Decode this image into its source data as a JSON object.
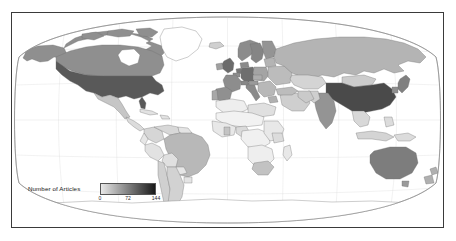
{
  "figure": {
    "type": "choropleth-world-map",
    "projection": "robinson",
    "frame_color": "#3a3a3a",
    "background": "#ffffff"
  },
  "legend": {
    "title": "Number of Articles",
    "gradient_low_color": "#e8e8e8",
    "gradient_high_color": "#1a1a1a",
    "ticks": [
      {
        "label": "0",
        "value": 0,
        "pos_pct": 0
      },
      {
        "label": "72",
        "value": 72,
        "pos_pct": 50
      },
      {
        "label": "144",
        "value": 144,
        "pos_pct": 100
      }
    ]
  },
  "chart_data": {
    "type": "heatmap",
    "title": "",
    "xlabel": "",
    "ylabel": "",
    "legend_label": "Number of Articles",
    "value_range": [
      0,
      144
    ],
    "colorscale": [
      "#ffffff",
      "#e8e8e8",
      "#c9c9c9",
      "#a8a8a8",
      "#8a8a8a",
      "#6b6b6b",
      "#4a4a4a",
      "#2b2b2b"
    ],
    "countries": [
      {
        "name": "United States",
        "value": 144,
        "color": "#595959"
      },
      {
        "name": "China",
        "value": 140,
        "color": "#4a4a4a"
      },
      {
        "name": "United Kingdom",
        "value": 105,
        "color": "#6b6b6b"
      },
      {
        "name": "Germany",
        "value": 100,
        "color": "#6e6e6e"
      },
      {
        "name": "Canada",
        "value": 88,
        "color": "#8f8f8f"
      },
      {
        "name": "Australia",
        "value": 86,
        "color": "#7d7d7d"
      },
      {
        "name": "Japan",
        "value": 80,
        "color": "#808080"
      },
      {
        "name": "India",
        "value": 72,
        "color": "#949494"
      },
      {
        "name": "Netherlands",
        "value": 68,
        "color": "#787878"
      },
      {
        "name": "Italy",
        "value": 62,
        "color": "#8a8a8a"
      },
      {
        "name": "France",
        "value": 60,
        "color": "#8d8d8d"
      },
      {
        "name": "Spain",
        "value": 55,
        "color": "#909090"
      },
      {
        "name": "Sweden",
        "value": 52,
        "color": "#858585"
      },
      {
        "name": "Norway",
        "value": 48,
        "color": "#8c8c8c"
      },
      {
        "name": "Finland",
        "value": 45,
        "color": "#949494"
      },
      {
        "name": "Denmark",
        "value": 44,
        "color": "#8a8a8a"
      },
      {
        "name": "Switzerland",
        "value": 42,
        "color": "#888888"
      },
      {
        "name": "Belgium",
        "value": 40,
        "color": "#8e8e8e"
      },
      {
        "name": "Austria",
        "value": 36,
        "color": "#9a9a9a"
      },
      {
        "name": "Poland",
        "value": 34,
        "color": "#a4a4a4"
      },
      {
        "name": "Russia",
        "value": 30,
        "color": "#b4b4b4"
      },
      {
        "name": "Brazil",
        "value": 28,
        "color": "#b8b8b8"
      },
      {
        "name": "South Korea",
        "value": 26,
        "color": "#8f8f8f"
      },
      {
        "name": "Turkey",
        "value": 24,
        "color": "#bcbcbc"
      },
      {
        "name": "South Africa",
        "value": 22,
        "color": "#c2c2c2"
      },
      {
        "name": "Mexico",
        "value": 20,
        "color": "#c6c6c6"
      },
      {
        "name": "New Zealand",
        "value": 20,
        "color": "#b0b0b0"
      },
      {
        "name": "Ireland",
        "value": 18,
        "color": "#a0a0a0"
      },
      {
        "name": "Portugal",
        "value": 18,
        "color": "#a8a8a8"
      },
      {
        "name": "Greece",
        "value": 16,
        "color": "#b0b0b0"
      },
      {
        "name": "Czechia",
        "value": 16,
        "color": "#adadad"
      },
      {
        "name": "Iran",
        "value": 14,
        "color": "#cacaca"
      },
      {
        "name": "Argentina",
        "value": 12,
        "color": "#d2d2d2"
      },
      {
        "name": "Chile",
        "value": 12,
        "color": "#d0d0d0"
      },
      {
        "name": "Indonesia",
        "value": 10,
        "color": "#d4d4d4"
      },
      {
        "name": "Nigeria",
        "value": 8,
        "color": "#dadada"
      },
      {
        "name": "Kenya",
        "value": 8,
        "color": "#dcdcdc"
      },
      {
        "name": "Egypt",
        "value": 6,
        "color": "#e0e0e0"
      },
      {
        "name": "Thailand",
        "value": 6,
        "color": "#d8d8d8"
      },
      {
        "name": "Ghana",
        "value": 5,
        "color": "#c4c4c4"
      },
      {
        "name": "Other countries",
        "value": 0,
        "color": "#ffffff"
      }
    ],
    "grid": false,
    "legend_position": "bottom-left-inset"
  }
}
